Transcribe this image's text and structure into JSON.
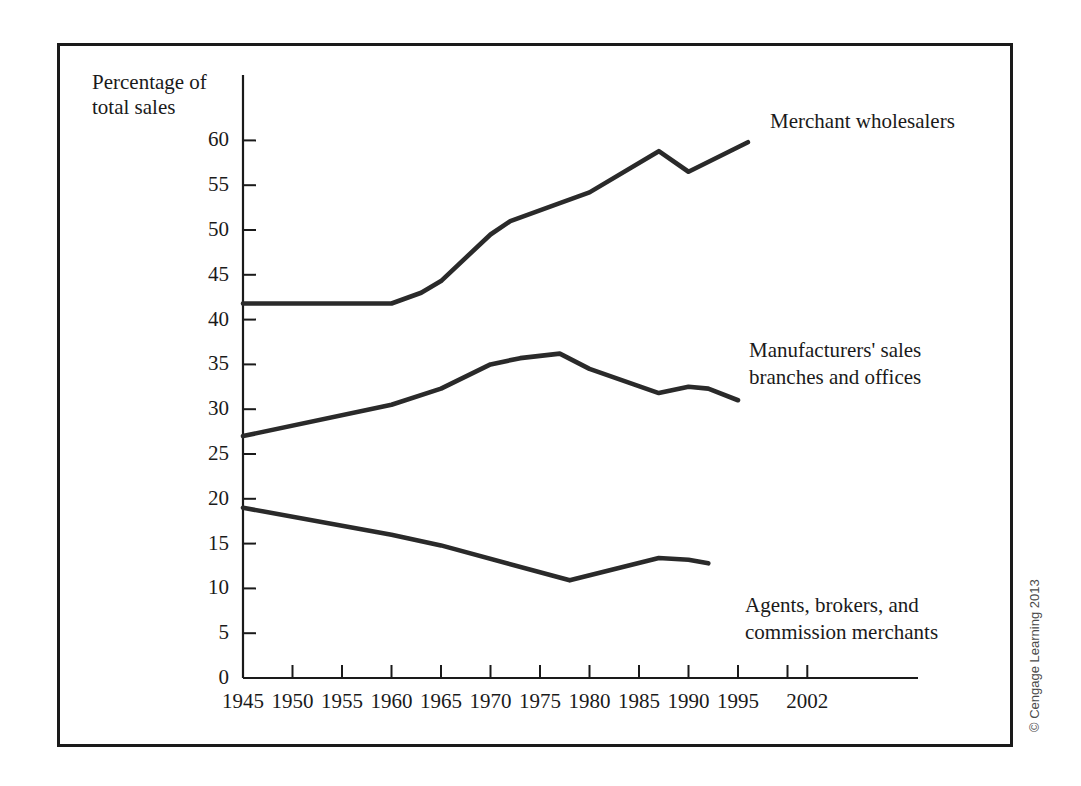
{
  "figure": {
    "y_axis_title_line1": "Percentage of",
    "y_axis_title_line2": "total sales",
    "copyright": "© Cengage Learning 2013",
    "frame_color": "#1a1a1a",
    "line_color": "#2a2a2a",
    "background": "#ffffff"
  },
  "annotations": {
    "merchant": "Merchant wholesalers",
    "manufacturers_line1": "Manufacturers' sales",
    "manufacturers_line2": "branches and offices",
    "agents_line1": "Agents, brokers, and",
    "agents_line2": "commission merchants"
  },
  "chart_data": {
    "type": "line",
    "title": "",
    "xlabel": "",
    "ylabel": "Percentage of total sales",
    "xlim": [
      1945,
      2004
    ],
    "ylim": [
      0,
      63
    ],
    "grid": false,
    "legend_position": "inline-annotations",
    "x_ticks": [
      1945,
      1950,
      1955,
      1960,
      1965,
      1970,
      1975,
      1980,
      1985,
      1990,
      1995,
      2000,
      2002
    ],
    "x_tick_labels": [
      "1945",
      "1950",
      "1955",
      "1960",
      "1965",
      "1970",
      "1975",
      "1980",
      "1985",
      "1990",
      "1995",
      "",
      "2002"
    ],
    "y_ticks": [
      0,
      5,
      10,
      15,
      20,
      25,
      30,
      35,
      40,
      45,
      50,
      55,
      60
    ],
    "y_tick_labels": [
      "0",
      "5",
      "10",
      "15",
      "20",
      "25",
      "30",
      "35",
      "40",
      "45",
      "50",
      "55",
      "60"
    ],
    "series": [
      {
        "name": "Merchant wholesalers",
        "x": [
          1945,
          1960,
          1963,
          1965,
          1970,
          1972,
          1977,
          1980,
          1987,
          1990,
          1996
        ],
        "values": [
          41.8,
          41.8,
          43.0,
          44.3,
          49.5,
          51.0,
          53.0,
          54.2,
          58.8,
          56.5,
          59.8
        ]
      },
      {
        "name": "Manufacturers' sales branches and offices",
        "x": [
          1945,
          1960,
          1965,
          1970,
          1973,
          1977,
          1980,
          1987,
          1990,
          1992,
          1995
        ],
        "values": [
          27.0,
          30.5,
          32.3,
          35.0,
          35.7,
          36.2,
          34.5,
          31.8,
          32.5,
          32.3,
          31.0
        ]
      },
      {
        "name": "Agents, brokers, and commission merchants",
        "x": [
          1945,
          1960,
          1965,
          1978,
          1987,
          1990,
          1992
        ],
        "values": [
          19.0,
          16.0,
          14.8,
          10.9,
          13.4,
          13.2,
          12.8
        ]
      }
    ]
  }
}
